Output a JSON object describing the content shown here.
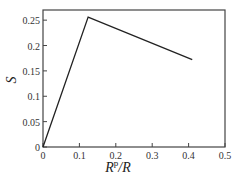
{
  "chart_data": {
    "type": "line",
    "title": "",
    "xlabel": "R^p/R",
    "ylabel": "S",
    "xlim": [
      0,
      0.5
    ],
    "ylim": [
      0,
      0.27
    ],
    "xticks": [
      0,
      0.1,
      0.2,
      0.3,
      0.4,
      0.5
    ],
    "yticks": [
      0,
      0.05,
      0.1,
      0.15,
      0.2,
      0.25
    ],
    "xtick_labels": [
      "0",
      "0.1",
      "0.2",
      "0.3",
      "0.4",
      "0.5"
    ],
    "ytick_labels": [
      "0",
      "0.05",
      "0.1",
      "0.15",
      "0.2",
      "0.25"
    ],
    "grid": false,
    "legend": null,
    "series": [
      {
        "name": "S",
        "color": "#222222",
        "x": [
          0,
          0.124,
          0.41
        ],
        "y": [
          0,
          0.256,
          0.172
        ]
      }
    ]
  },
  "labels": {
    "xlabel_main": "R",
    "xlabel_sup": "p",
    "xlabel_tail": "/R",
    "ylabel": "S"
  }
}
